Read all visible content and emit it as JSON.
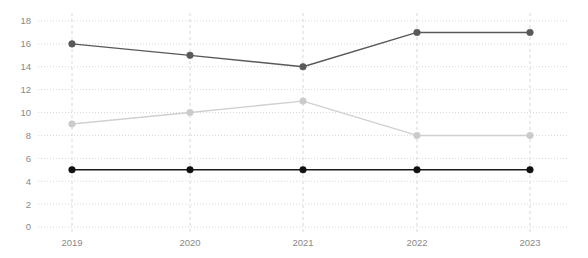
{
  "chart_data": {
    "type": "line",
    "title": "",
    "xlabel": "",
    "ylabel": "",
    "categories": [
      "2019",
      "2020",
      "2021",
      "2022",
      "2023"
    ],
    "x": [
      2019,
      2020,
      2021,
      2022,
      2023
    ],
    "ylim": [
      0,
      18
    ],
    "xlim": [
      2019,
      2023
    ],
    "yticks": [
      0,
      2,
      4,
      6,
      8,
      10,
      12,
      14,
      16,
      18
    ],
    "ytick_labels": [
      "0",
      "2",
      "4",
      "6",
      "8",
      "10",
      "12",
      "14",
      "16",
      "18"
    ],
    "xtick_labels": [
      "2019",
      "2020",
      "2021",
      "2022",
      "2023"
    ],
    "grid": true,
    "grid_horizontal_style": "dotted",
    "grid_vertical_style": "dashed",
    "grid_color": "#d8d8d8",
    "legend": "none",
    "legend_position": "none",
    "markers": "circle",
    "background_color": "#ffffff",
    "series": [
      {
        "name": "series-dark-gray",
        "color": "#595959",
        "marker_color": "#595959",
        "values": [
          16,
          15,
          14,
          17,
          17
        ]
      },
      {
        "name": "series-light-gray",
        "color": "#d0d0d0",
        "marker_color": "#cbcbcb",
        "values": [
          9,
          10,
          11,
          8,
          8
        ]
      },
      {
        "name": "series-black",
        "color": "#1a1a1a",
        "marker_color": "#111111",
        "values": [
          5,
          5,
          5,
          5,
          5
        ]
      }
    ]
  },
  "axis": {
    "tick_label_color": "#8a8a8a"
  }
}
